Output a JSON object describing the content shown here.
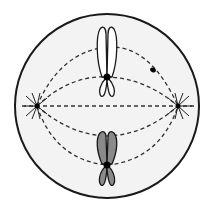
{
  "diagram": {
    "colors": {
      "background": "#ffffff",
      "cytoplasm": "#f3f3f3",
      "outline": "#1a1a1a",
      "chromosome_light": "#ffffff",
      "chromosome_dark": "#8a8a8a",
      "spindle": "#333333"
    },
    "cell": {
      "cx": 107,
      "cy": 106,
      "r": 92
    },
    "poles": [
      {
        "name": "left-centrosome",
        "x": 37,
        "y": 106
      },
      {
        "name": "right-centrosome",
        "x": 178,
        "y": 106
      }
    ],
    "chromosomes": [
      {
        "name": "upper-chromosome",
        "fill": "light",
        "centromere_x": 107,
        "centromere_y": 77
      },
      {
        "name": "lower-chromosome",
        "fill": "dark",
        "centromere_x": 107,
        "centromere_y": 165
      }
    ],
    "extra_dot": {
      "x": 153,
      "y": 70
    }
  }
}
